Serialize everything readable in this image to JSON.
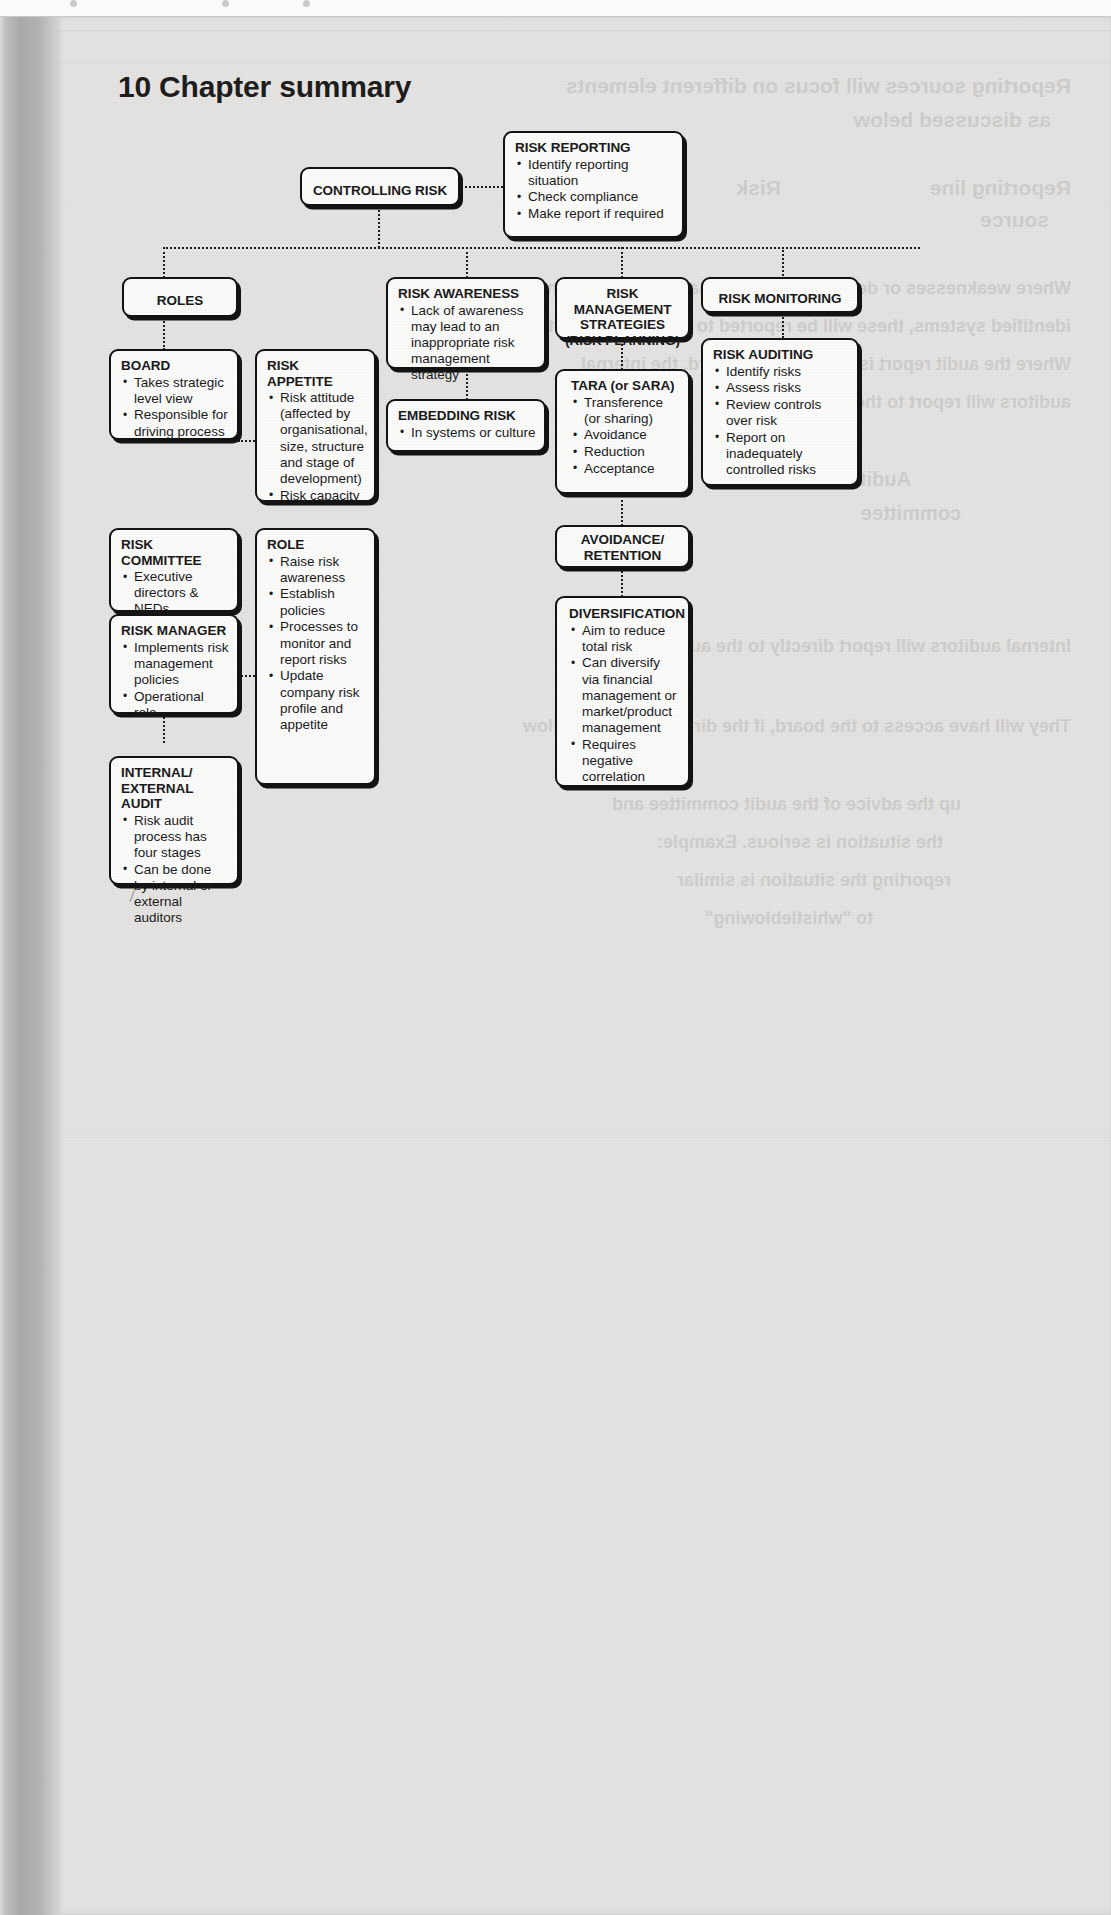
{
  "page": {
    "heading": "10 Chapter summary"
  },
  "diagram": {
    "type": "flowchart",
    "root": {
      "id": "controlling-risk",
      "title": "CONTROLLING RISK"
    },
    "nodes": [
      {
        "id": "controlling-risk",
        "title": "CONTROLLING RISK",
        "items": []
      },
      {
        "id": "risk-reporting",
        "title": "RISK REPORTING",
        "items": [
          "Identify reporting situation",
          "Check compliance",
          "Make report if required"
        ]
      },
      {
        "id": "roles",
        "title": "ROLES",
        "items": []
      },
      {
        "id": "board",
        "title": "BOARD",
        "items": [
          "Takes strategic level view",
          "Responsible for driving process"
        ]
      },
      {
        "id": "risk-appetite",
        "title": "RISK APPETITE",
        "items": [
          "Risk attitude (affected by organisational, size, structure and stage of development)",
          "Risk capacity"
        ]
      },
      {
        "id": "risk-committee",
        "title": "RISK COMMITTEE",
        "items": [
          "Executive directors & NEDs"
        ]
      },
      {
        "id": "role",
        "title": "ROLE",
        "items": [
          "Raise risk awareness",
          "Establish policies",
          "Processes to monitor and report risks",
          "Update company risk profile and appetite"
        ]
      },
      {
        "id": "risk-manager",
        "title": "RISK MANAGER",
        "items": [
          "Implements risk management policies",
          "Operational role"
        ]
      },
      {
        "id": "internal-external-audit",
        "title": "INTERNAL/ EXTERNAL AUDIT",
        "items": [
          "Risk audit process has four stages",
          "Can be done by internal or external auditors"
        ]
      },
      {
        "id": "risk-awareness",
        "title": "RISK AWARENESS",
        "items": [
          "Lack of awareness may lead to an inappropriate risk management strategy"
        ]
      },
      {
        "id": "embedding-risk",
        "title": "EMBEDDING RISK",
        "items": [
          "In systems or culture"
        ]
      },
      {
        "id": "risk-management-strategies",
        "title": "RISK MANAGEMENT STRATEGIES (RISK PLANNING)",
        "items": []
      },
      {
        "id": "tara",
        "title": "TARA (or SARA)",
        "items": [
          "Transference (or sharing)",
          "Avoidance",
          "Reduction",
          "Acceptance"
        ]
      },
      {
        "id": "avoidance-retention",
        "title": "AVOIDANCE/ RETENTION",
        "items": []
      },
      {
        "id": "diversification",
        "title": "DIVERSIFICATION",
        "items": [
          "Aim to reduce total risk",
          "Can diversify via financial management or market/product management",
          "Requires negative correlation"
        ]
      },
      {
        "id": "risk-monitoring",
        "title": "RISK MONITORING",
        "items": []
      },
      {
        "id": "risk-auditing",
        "title": "RISK AUDITING",
        "items": [
          "Identify risks",
          "Assess risks",
          "Review controls over risk",
          "Report on inadequately controlled risks"
        ]
      }
    ],
    "titles": {
      "controlling_risk": "CONTROLLING RISK",
      "risk_reporting": "RISK REPORTING",
      "roles": "ROLES",
      "board": "BOARD",
      "risk_appetite": "RISK APPETITE",
      "risk_committee": "RISK COMMITTEE",
      "role": "ROLE",
      "risk_manager": "RISK MANAGER",
      "internal_external_audit_l1": "INTERNAL/",
      "internal_external_audit_l2": "EXTERNAL AUDIT",
      "risk_awareness": "RISK AWARENESS",
      "embedding_risk": "EMBEDDING RISK",
      "rms_l1": "RISK MANAGEMENT",
      "rms_l2": "STRATEGIES",
      "rms_l3": "(RISK PLANNING)",
      "tara": "TARA (or SARA)",
      "avoidance_retention_l1": "AVOIDANCE/",
      "avoidance_retention_l2": "RETENTION",
      "diversification": "DIVERSIFICATION",
      "risk_monitoring": "RISK MONITORING",
      "risk_auditing": "RISK AUDITING"
    },
    "bullets": {
      "risk_reporting": [
        "Identify reporting situation",
        "Check compliance",
        "Make report if required"
      ],
      "board": [
        "Takes strategic level view",
        "Responsible for driving process"
      ],
      "risk_appetite": [
        "Risk attitude (affected by organisational, size, structure and stage of development)",
        "Risk capacity"
      ],
      "risk_committee": [
        "Executive directors & NEDs"
      ],
      "role": [
        "Raise risk awareness",
        "Establish policies",
        "Processes to monitor and report risks",
        "Update company risk profile and appetite"
      ],
      "risk_manager": [
        "Implements risk management policies",
        "Operational role"
      ],
      "internal_external_audit": [
        "Risk audit process has four stages",
        "Can be done by internal or external auditors"
      ],
      "risk_awareness": [
        "Lack of awareness may lead to an inappropriate risk management strategy"
      ],
      "embedding_risk": [
        "In systems or culture"
      ],
      "tara": [
        "Transference (or sharing)",
        "Avoidance",
        "Reduction",
        "Acceptance"
      ],
      "diversification": [
        "Aim to reduce total risk",
        "Can diversify via financial management or market/product management",
        "Requires negative correlation"
      ],
      "risk_auditing": [
        "Identify risks",
        "Assess risks",
        "Review controls over risk",
        "Report on inadequately controlled risks"
      ]
    }
  },
  "bleedthrough": {
    "lines": [
      "Reporting sources will focus on different elements",
      "as discussed below",
      "Reporting line",
      "source",
      "Risk",
      "Audit",
      "committee",
      "Where weaknesses or deficiencies in internal controls will only be",
      "identified systems, these will be reported to the audit committee",
      "Where the audit report is issued to the board, the internal",
      "auditors will report to the audit committee",
      "Internal auditors will report directly to the audit committee",
      "They will have access to the board, if the directors do not follow",
      "up the advice of the audit committee and",
      "the situation is serious. Example:",
      "reporting the situation is similar",
      "to \"whistleblowing\""
    ]
  },
  "colors": {
    "ink": "#131313",
    "paper": "#e4e3e1",
    "box_fill": "#fbfbfa",
    "spine": "#a9a9a9"
  }
}
